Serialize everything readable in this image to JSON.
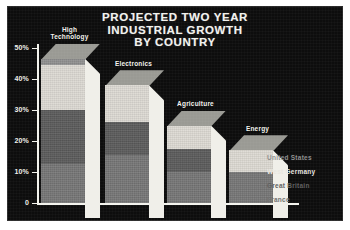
{
  "chart_data": {
    "type": "bar",
    "title": "PROJECTED TWO YEAR INDUSTRIAL GROWTH BY COUNTRY",
    "title_lines": [
      "PROJECTED TWO YEAR",
      "INDUSTRIAL GROWTH",
      "BY COUNTRY"
    ],
    "xlabel": "",
    "ylabel": "",
    "ylim": [
      0,
      50
    ],
    "grid": false,
    "stacked": true,
    "legend_position": "right",
    "yticks": [
      0,
      10,
      20,
      30,
      40,
      50
    ],
    "ytick_labels": [
      "0",
      "10%",
      "20%",
      "30%",
      "40%",
      "50%"
    ],
    "categories": [
      "High Technology",
      "Electronics",
      "Agriculture",
      "Energy"
    ],
    "category_label_lines": [
      [
        "High",
        "Technology"
      ],
      [
        "Electronics"
      ],
      [
        "Agriculture"
      ],
      [
        "Energy"
      ]
    ],
    "series": [
      {
        "name": "France",
        "color": "#757575",
        "values": [
          12.5,
          15.5,
          10.0,
          10.0
        ]
      },
      {
        "name": "Great Britain",
        "color": "#5a5a5a",
        "values": [
          17.5,
          10.5,
          7.5,
          0.0
        ]
      },
      {
        "name": "West Germany",
        "color": "#dddad3",
        "values": [
          14.5,
          12.0,
          7.5,
          7.0
        ]
      },
      {
        "name": "United States",
        "color": "#8f8f8f",
        "values": [
          2.0,
          0.0,
          0.0,
          0.0
        ]
      }
    ],
    "totals": [
      46.5,
      38.0,
      25.0,
      17.0
    ],
    "legend_entries": [
      {
        "label": "United States",
        "color": "#8f8f8f"
      },
      {
        "label": "West Germany",
        "color": "#e8e6e0"
      },
      {
        "label": "Great Britain",
        "color": "#5e5e5e"
      },
      {
        "label": "France",
        "color": "#6f6f6f"
      }
    ],
    "colors": {
      "background": "#0d0d0d",
      "page": "#ffffff",
      "axis": "#f4f4ee",
      "text": "#f2f2ee",
      "bar_side": "#f0efe9",
      "bar_top": "#9a9a94"
    }
  }
}
